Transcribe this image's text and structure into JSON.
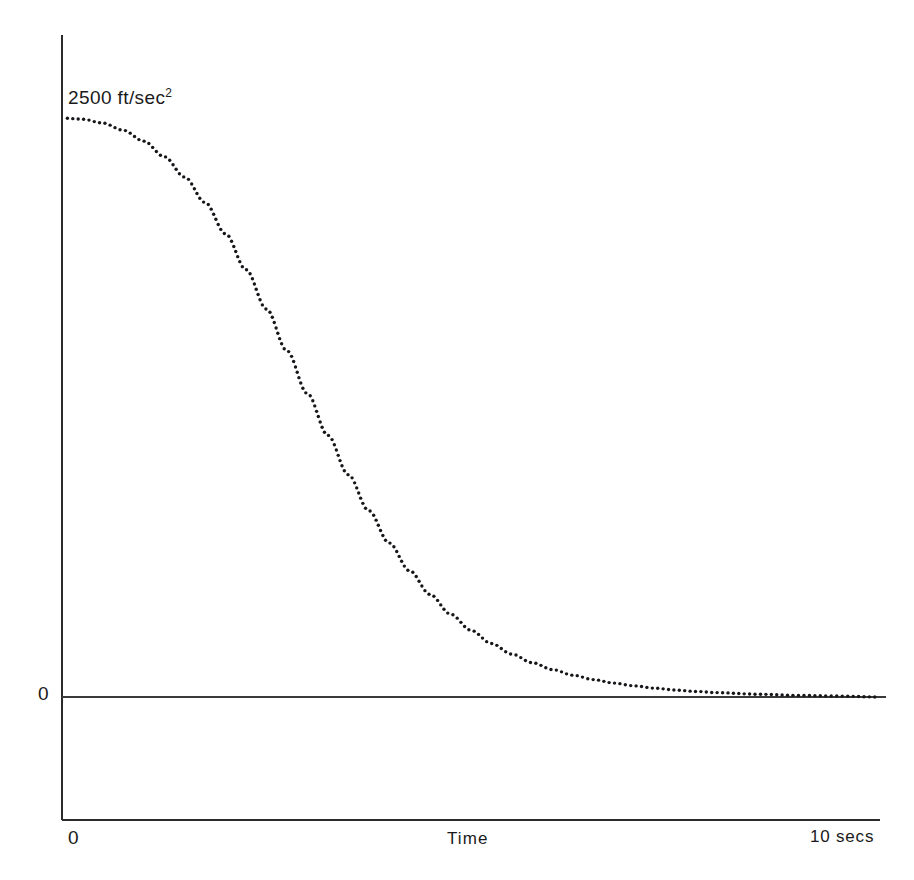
{
  "figure": {
    "background": "#ffffff",
    "ink_color": "#16161a",
    "axis_color": "#2b2b2b"
  },
  "labels": {
    "y_max_value": "2500",
    "y_max_units": " ft/sec",
    "y_max_exponent": "2",
    "y_max_full": "2500 ft/sec2",
    "y_zero": "0",
    "x_min": "0",
    "x_axis_title": "Time",
    "x_max": "10 secs"
  },
  "geometry": {
    "y_axis_x": 62,
    "y_axis_top": 35,
    "y_axis_bottom": 820,
    "zero_line_y": 697,
    "zero_line_x_end": 886,
    "x_axis_y": 820,
    "x_axis_x_end": 880,
    "curve_x_start": 62,
    "curve_x_end": 880,
    "curve_y_top": 118,
    "dot_radius": 1.7,
    "dot_spacing_px": 5.4
  },
  "chart_data": {
    "type": "line",
    "title": "",
    "subtitle": "",
    "xlabel": "Time",
    "ylabel": "",
    "xlim": [
      0,
      10
    ],
    "ylim": [
      0,
      2500
    ],
    "grid": false,
    "legend": false,
    "legend_position": "none",
    "marker": "dotted",
    "annotations": [
      {
        "text": "2500 ft/sec2",
        "x": 0,
        "y": 2500,
        "position": "above-left-of-curve-start"
      },
      {
        "text": "0",
        "x": 0,
        "y": 0,
        "position": "left-of-zero-line"
      },
      {
        "text": "10 secs",
        "x": 10,
        "y": 0,
        "position": "below-axis-right"
      }
    ],
    "x_tick_labels": [
      "0",
      "10 secs"
    ],
    "y_tick_labels": [
      "0",
      "2500 ft/sec2"
    ],
    "series": [
      {
        "name": "Acceleration decay",
        "units": "ft/sec^2",
        "x": [
          0.0,
          0.25,
          0.5,
          0.75,
          1.0,
          1.25,
          1.5,
          1.75,
          2.0,
          2.25,
          2.5,
          2.75,
          3.0,
          3.25,
          3.5,
          3.75,
          4.0,
          4.25,
          4.5,
          4.75,
          5.0,
          5.25,
          5.5,
          5.75,
          6.0,
          6.25,
          6.5,
          6.75,
          7.0,
          7.25,
          7.5,
          7.75,
          8.0,
          8.5,
          9.0,
          9.5,
          10.0
        ],
        "values": [
          2500,
          2495,
          2478,
          2447,
          2400,
          2333,
          2245,
          2135,
          2000,
          1845,
          1675,
          1495,
          1310,
          1130,
          960,
          805,
          665,
          545,
          443,
          358,
          288,
          231,
          185,
          148,
          118,
          94,
          75,
          60,
          48,
          38,
          30,
          24,
          19,
          12,
          7,
          4,
          0
        ]
      }
    ]
  }
}
